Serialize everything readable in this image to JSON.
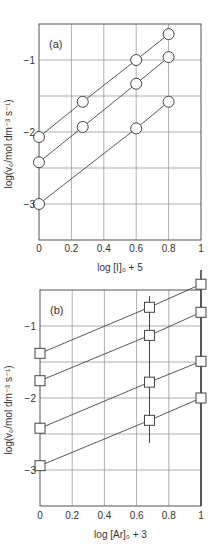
{
  "chart_data": [
    {
      "type": "line",
      "panel_label": "(a)",
      "xlabel": "log [I]₀ + 5",
      "ylabel": "log(v₀/mol dm⁻³ s⁻¹)",
      "xlim": [
        0,
        1
      ],
      "ylim": [
        -3.5,
        -0.5
      ],
      "xticks": [
        "0",
        "0.2",
        "0.4",
        "0.6",
        "0.8",
        "1"
      ],
      "yticks": [
        {
          "v": -1,
          "label": "−1"
        },
        {
          "v": -2,
          "label": "−2"
        },
        {
          "v": -3,
          "label": "−3"
        }
      ],
      "grid": true,
      "marker": "circle",
      "series": [
        {
          "name": "series 1",
          "x": [
            0,
            0.27,
            0.6,
            0.8
          ],
          "y": [
            -2.07,
            -1.58,
            -1.0,
            -0.64
          ]
        },
        {
          "name": "series 2",
          "x": [
            0,
            0.27,
            0.6,
            0.8
          ],
          "y": [
            -2.42,
            -1.93,
            -1.33,
            -0.96
          ]
        },
        {
          "name": "series 3",
          "x": [
            0,
            0.6,
            0.8
          ],
          "y": [
            -3.0,
            -1.95,
            -1.58
          ]
        }
      ]
    },
    {
      "type": "line",
      "panel_label": "(b)",
      "xlabel": "log [Ar]₀ + 3",
      "ylabel": "log(v₀/mol dm⁻³ s⁻¹)",
      "xlim": [
        0,
        1
      ],
      "ylim": [
        -3.5,
        -0.5
      ],
      "xticks": [
        "0",
        "0.2",
        "0.4",
        "0.6",
        "0.8",
        "1"
      ],
      "yticks": [
        {
          "v": -1,
          "label": "−1"
        },
        {
          "v": -2,
          "label": "−2"
        },
        {
          "v": -3,
          "label": "−3"
        }
      ],
      "grid": true,
      "marker": "square",
      "vertical_lines_x": [
        0.68,
        1.0
      ],
      "series": [
        {
          "name": "series 1",
          "x": [
            0,
            0.68,
            1
          ],
          "y": [
            -1.38,
            -0.74,
            -0.42
          ]
        },
        {
          "name": "series 2",
          "x": [
            0,
            0.68,
            1
          ],
          "y": [
            -1.76,
            -1.13,
            -0.81
          ]
        },
        {
          "name": "series 3",
          "x": [
            0,
            0.68,
            1
          ],
          "y": [
            -2.42,
            -1.78,
            -1.49
          ]
        },
        {
          "name": "series 4",
          "x": [
            0,
            0.68,
            1
          ],
          "y": [
            -2.94,
            -2.31,
            -2.0
          ]
        }
      ]
    }
  ]
}
